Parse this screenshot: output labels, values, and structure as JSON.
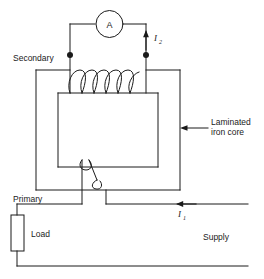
{
  "figure": {
    "kind": "circuit-diagram",
    "stroke_color": "#1a1a1a",
    "background_color": "#ffffff"
  },
  "labels": {
    "secondary": "Secondary",
    "primary": "Primary",
    "load": "Load",
    "supply": "Supply",
    "core_line1": "Laminated",
    "core_line2": "iron core"
  },
  "meter": {
    "symbol": "A",
    "name": "ammeter"
  },
  "currents": {
    "secondary": {
      "symbol": "I",
      "subscript": "2",
      "direction": "up"
    },
    "primary": {
      "symbol": "I",
      "subscript": "1",
      "direction": "left"
    }
  },
  "windings": {
    "secondary_turns": 5,
    "primary_turns": 1
  }
}
